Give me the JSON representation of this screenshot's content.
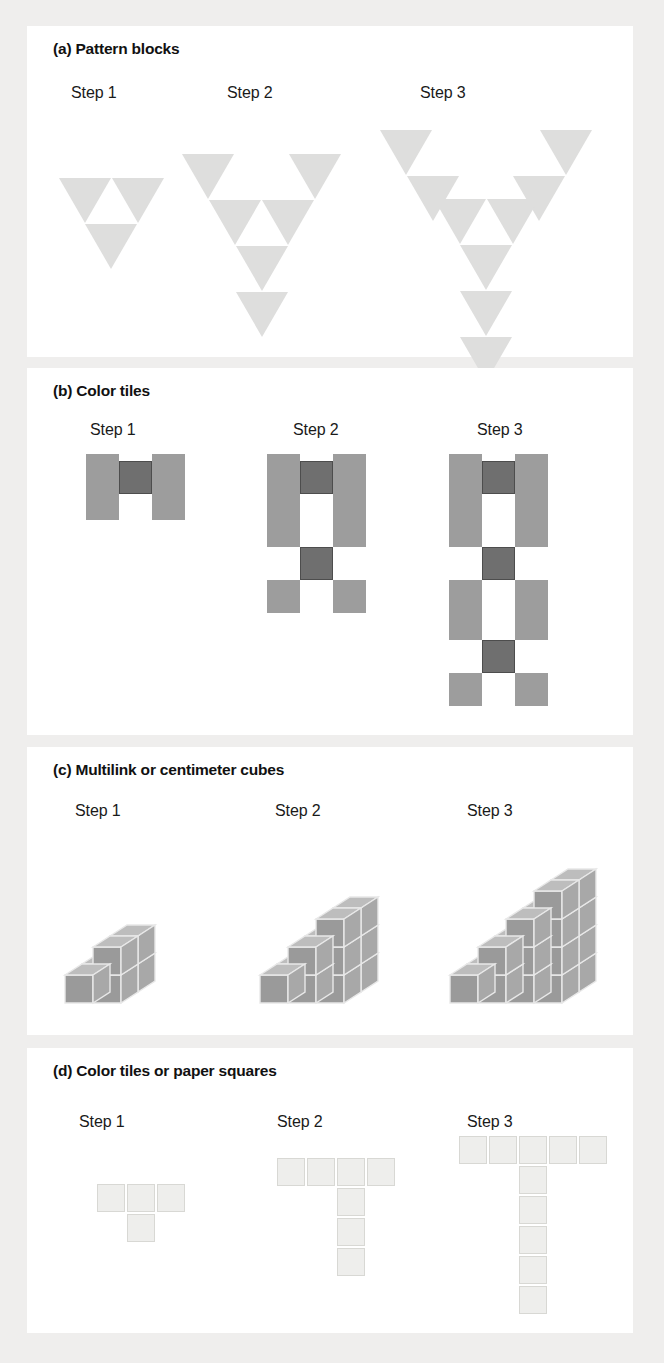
{
  "figure": {
    "background_color": "#efeeed",
    "panel_color": "#ffffff",
    "sections": [
      {
        "id": "a",
        "title": "(a) Pattern blocks"
      },
      {
        "id": "b",
        "title": "(b) Color tiles"
      },
      {
        "id": "c",
        "title": "(c) Multilink or centimeter cubes"
      },
      {
        "id": "d",
        "title": "(d) Color tiles or paper squares"
      }
    ],
    "step_labels": [
      "Step 1",
      "Step 2",
      "Step 3"
    ]
  },
  "chart_data": {
    "type": "table",
    "xlabel": "Step number",
    "ylabel": "Number of pieces",
    "categories": [
      "Step 1",
      "Step 2",
      "Step 3"
    ],
    "series": [
      {
        "name": "(a) Pattern blocks (triangles)",
        "values": [
          3,
          6,
          9
        ]
      },
      {
        "name": "(b) Color tiles (total tiles)",
        "values": [
          5,
          9,
          13
        ]
      },
      {
        "name": "(b) Color tiles (light gray)",
        "values": [
          4,
          6,
          8
        ]
      },
      {
        "name": "(b) Color tiles (dark gray)",
        "values": [
          1,
          3,
          5
        ]
      },
      {
        "name": "(c) Multilink cubes",
        "values": [
          6,
          12,
          20
        ]
      },
      {
        "name": "(d) Color tiles or paper squares",
        "values": [
          4,
          7,
          10
        ]
      }
    ],
    "colors": {
      "triangle_fill": "#dededd",
      "tile_light": "#9d9d9d",
      "tile_dark": "#6f6f6f",
      "cube_top": "#bdbdbd",
      "cube_left": "#9a9a9a",
      "cube_right": "#a8a8a8",
      "paper_square_fill": "#eeeeec",
      "paper_square_border": "#d8d8d4"
    },
    "section_a": {
      "label": "(a) Pattern blocks",
      "shape": "downward-triangle",
      "steps": [
        {
          "step": "Step 1",
          "count": 3
        },
        {
          "step": "Step 2",
          "count": 6
        },
        {
          "step": "Step 3",
          "count": 9
        }
      ]
    },
    "section_b": {
      "label": "(b) Color tiles",
      "steps": [
        {
          "step": "Step 1",
          "light": 4,
          "dark": 1,
          "total": 5
        },
        {
          "step": "Step 2",
          "light": 6,
          "dark": 3,
          "total": 9
        },
        {
          "step": "Step 3",
          "light": 8,
          "dark": 5,
          "total": 13
        }
      ]
    },
    "section_c": {
      "label": "(c) Multilink or centimeter cubes",
      "steps": [
        {
          "step": "Step 1",
          "stair_heights": [
            1,
            2
          ],
          "count": 6
        },
        {
          "step": "Step 2",
          "stair_heights": [
            1,
            2,
            3
          ],
          "count": 12
        },
        {
          "step": "Step 3",
          "stair_heights": [
            1,
            2,
            3,
            4
          ],
          "count": 20
        }
      ]
    },
    "section_d": {
      "label": "(d) Color tiles or paper squares",
      "steps": [
        {
          "step": "Step 1",
          "top_row": 3,
          "stem": 1,
          "count": 4
        },
        {
          "step": "Step 2",
          "top_row": 4,
          "stem": 3,
          "count": 7
        },
        {
          "step": "Step 3",
          "top_row": 5,
          "stem": 5,
          "count": 10
        }
      ]
    }
  }
}
